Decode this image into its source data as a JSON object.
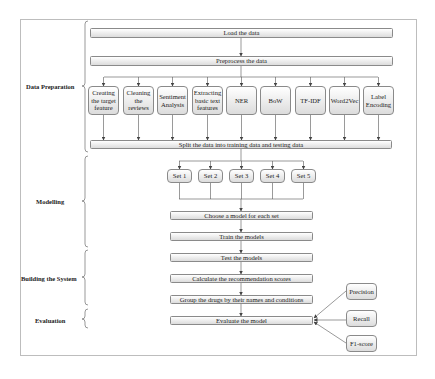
{
  "sections": [
    {
      "label": "Data Preparation"
    },
    {
      "label": "Modelling"
    },
    {
      "label": "Building the System"
    },
    {
      "label": "Evaluation"
    }
  ],
  "steps": {
    "load": "Load the data",
    "preprocess": "Preprocess the data",
    "split": "Split the data into training data and testing data",
    "choose": "Choose a model for each set",
    "train": "Train the models",
    "test": "Test the models",
    "calculate": "Calculate the recommendation scores",
    "group": "Group the drugs by their names and conditions",
    "evaluate": "Evaluate the model"
  },
  "features": [
    {
      "label": "Creating the target feature"
    },
    {
      "label": "Cleaning the reviews"
    },
    {
      "label": "Sentiment Analysis"
    },
    {
      "label": "Extracting basic text features"
    },
    {
      "label": "NER"
    },
    {
      "label": "BoW"
    },
    {
      "label": "TF-IDF"
    },
    {
      "label": "Word2Vec"
    },
    {
      "label": "Label Encoding"
    }
  ],
  "sets": [
    {
      "label": "Set 1"
    },
    {
      "label": "Set 2"
    },
    {
      "label": "Set 3"
    },
    {
      "label": "Set 4"
    },
    {
      "label": "Set 5"
    }
  ],
  "metrics": [
    {
      "label": "Precision"
    },
    {
      "label": "Recall"
    },
    {
      "label": "F1-score"
    }
  ]
}
